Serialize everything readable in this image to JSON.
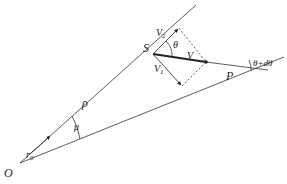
{
  "diagram": {
    "type": "geometry-vector-diagram",
    "labels": {
      "origin": "O",
      "point_s": "S",
      "point_p": "P",
      "rho": "ρ",
      "r0": "r",
      "r0_sub": "0",
      "mu": "μ",
      "theta": "θ",
      "theta_dtheta": "θ+dθ",
      "v": "V",
      "v1": "V",
      "v1_sub": "1",
      "v2": "V",
      "v2_sub": "2"
    },
    "colors": {
      "line": "#333333",
      "background": "#ffffff"
    }
  }
}
